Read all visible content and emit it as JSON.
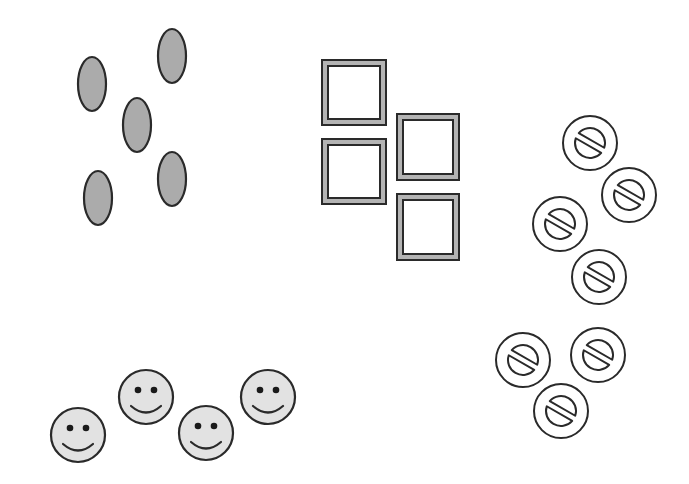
{
  "canvas": {
    "width": 689,
    "height": 484,
    "background": "#ffffff"
  },
  "colors": {
    "stroke": "#2a2a2a",
    "ellipse_fill": "#ababab",
    "square_band": "#b4b4b4",
    "square_inner": "#ffffff",
    "smiley_fill": "#e2e2e2",
    "symbol_fill": "#ffffff"
  },
  "groups": [
    {
      "name": "ellipse-group",
      "shape": "ellipse",
      "count": 5,
      "items": [
        {
          "cx": 92,
          "cy": 84,
          "rx": 14,
          "ry": 27
        },
        {
          "cx": 172,
          "cy": 56,
          "rx": 14,
          "ry": 27
        },
        {
          "cx": 137,
          "cy": 125,
          "rx": 14,
          "ry": 27
        },
        {
          "cx": 172,
          "cy": 179,
          "rx": 14,
          "ry": 27
        },
        {
          "cx": 98,
          "cy": 198,
          "rx": 14,
          "ry": 27
        }
      ]
    },
    {
      "name": "square-frame-group",
      "shape": "framed-square",
      "count": 4,
      "items": [
        {
          "x": 321,
          "y": 59,
          "w": 66,
          "h": 67
        },
        {
          "x": 321,
          "y": 138,
          "w": 66,
          "h": 67
        },
        {
          "x": 396,
          "y": 113,
          "w": 64,
          "h": 68
        },
        {
          "x": 396,
          "y": 193,
          "w": 64,
          "h": 68
        }
      ]
    },
    {
      "name": "split-circle-group",
      "shape": "split-circle-symbol",
      "count": 7,
      "items": [
        {
          "cx": 590,
          "cy": 143,
          "r": 28
        },
        {
          "cx": 629,
          "cy": 195,
          "r": 28
        },
        {
          "cx": 560,
          "cy": 224,
          "r": 28
        },
        {
          "cx": 599,
          "cy": 277,
          "r": 28
        },
        {
          "cx": 523,
          "cy": 360,
          "r": 28
        },
        {
          "cx": 598,
          "cy": 355,
          "r": 28
        },
        {
          "cx": 561,
          "cy": 411,
          "r": 28
        }
      ]
    },
    {
      "name": "smiley-group",
      "shape": "smiley-face",
      "count": 4,
      "items": [
        {
          "cx": 78,
          "cy": 435,
          "r": 28
        },
        {
          "cx": 146,
          "cy": 397,
          "r": 28
        },
        {
          "cx": 206,
          "cy": 433,
          "r": 28
        },
        {
          "cx": 268,
          "cy": 397,
          "r": 28
        }
      ]
    }
  ]
}
